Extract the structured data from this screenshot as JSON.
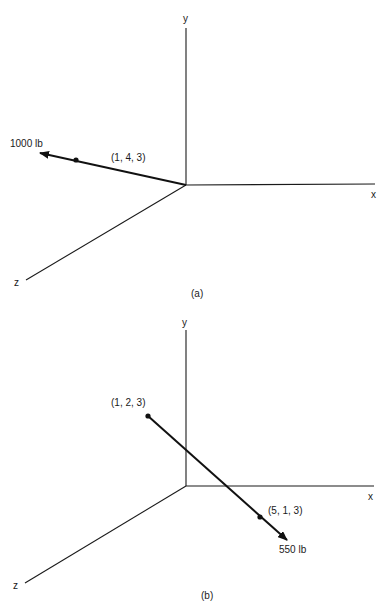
{
  "figure_a": {
    "caption": "(a)",
    "axes": {
      "x": "x",
      "y": "y",
      "z": "z"
    },
    "force": {
      "magnitude_label": "1000 lb",
      "point_label": "(1, 4, 3)",
      "direction": "from origin toward (1, 4, 3)"
    }
  },
  "figure_b": {
    "caption": "(b)",
    "axes": {
      "x": "x",
      "y": "y",
      "z": "z"
    },
    "force": {
      "magnitude_label": "550 lb",
      "start_label": "(1, 2, 3)",
      "end_label": "(5, 1, 3)",
      "direction": "from (1, 2, 3) toward (5, 1, 3)"
    }
  }
}
